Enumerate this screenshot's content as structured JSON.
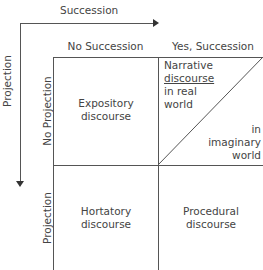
{
  "axes": {
    "horizontal_label": "Succession",
    "vertical_label": "Projection"
  },
  "columns": [
    "No Succession",
    "Yes, Succession"
  ],
  "rows": [
    "No Projection",
    "Projection"
  ],
  "cells": {
    "expository": "Expository discourse",
    "narrative_real_1": "Narrative",
    "narrative_real_2": "discourse",
    "narrative_real_3": "in real",
    "narrative_real_4": "world",
    "narrative_imag_1": "in",
    "narrative_imag_2": "imaginary",
    "narrative_imag_3": "world",
    "hortatory": "Hortatory discourse",
    "procedural": "Procedural discourse"
  },
  "colors": {
    "line": "#555555",
    "text": "#444444"
  }
}
